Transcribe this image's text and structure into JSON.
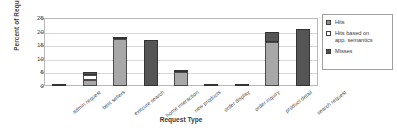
{
  "chart_data": {
    "type": "bar",
    "stacked": true,
    "title": "",
    "xlabel": "Request Type",
    "ylabel": "Percent of Requests",
    "ylim": [
      0,
      25
    ],
    "yticks": [
      0,
      5,
      10,
      15,
      20,
      25
    ],
    "grid": true,
    "legend_position": "right",
    "categories": [
      "admin request",
      "best sellers",
      "execute search",
      "home interaction",
      "new products",
      "order display",
      "order inquiry",
      "product detail",
      "search request"
    ],
    "series": [
      {
        "name": "Hits",
        "color": "#a8a8a8",
        "values": [
          0,
          2.1,
          17.2,
          0,
          5.0,
          0,
          0,
          16.0,
          0
        ]
      },
      {
        "name": "Hits based on\napp. semantics",
        "color": "#ffffff",
        "values": [
          0,
          1.9,
          0,
          0,
          0,
          0,
          0,
          0,
          0
        ]
      },
      {
        "name": "Misses",
        "color": "#555555",
        "values": [
          0.4,
          1.1,
          0.8,
          17.0,
          0.5,
          0.4,
          0.5,
          4.0,
          21.0
        ]
      }
    ]
  },
  "legend": {
    "items": [
      {
        "label": "Hits",
        "swatch": "hits-swatch"
      },
      {
        "label": "Hits based on\napp. semantics",
        "swatch": "semantics-swatch"
      },
      {
        "label": "Misses",
        "swatch": "misses-swatch"
      }
    ]
  },
  "axes": {
    "y_title": "Percent of Requests",
    "x_title": "Request Type",
    "y_tick_labels": [
      "25",
      "20",
      "15",
      "10",
      "5",
      "0"
    ]
  }
}
